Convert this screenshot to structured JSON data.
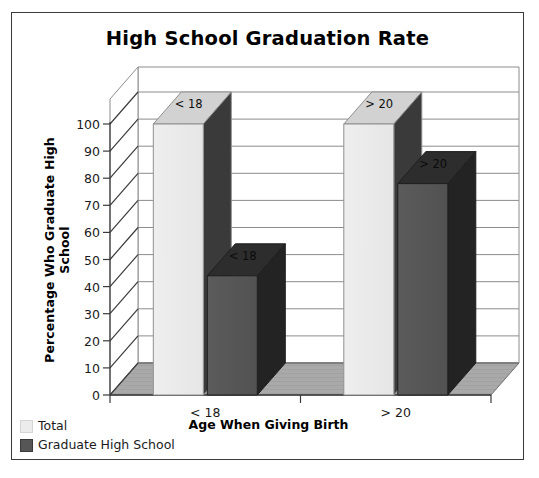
{
  "chart_data": {
    "type": "bar",
    "title": "High School Graduation Rate",
    "xlabel": "Age When Giving Birth",
    "ylabel": "Percentage Who Graduate High School",
    "categories": [
      "< 18",
      "> 20"
    ],
    "series": [
      {
        "name": "Total",
        "values": [
          100,
          100
        ],
        "color": "#ececec",
        "point_labels": [
          "< 18",
          "> 20"
        ]
      },
      {
        "name": "Graduate High School",
        "values": [
          44,
          78
        ],
        "color": "#565656",
        "point_labels": [
          "< 18",
          "> 20"
        ]
      }
    ],
    "ylim": [
      0,
      100
    ],
    "yticks": [
      0,
      10,
      20,
      30,
      40,
      50,
      60,
      70,
      80,
      90,
      100
    ],
    "grid": true,
    "legend_position": "bottom-left",
    "style": "3d",
    "floor_color": "#a8a8a8",
    "wall_color": "#ffffff",
    "border_color": "#3a3a3a"
  },
  "legend": {
    "items": [
      {
        "label": "Total",
        "color": "#ececec"
      },
      {
        "label": "Graduate High School",
        "color": "#565656"
      }
    ]
  }
}
